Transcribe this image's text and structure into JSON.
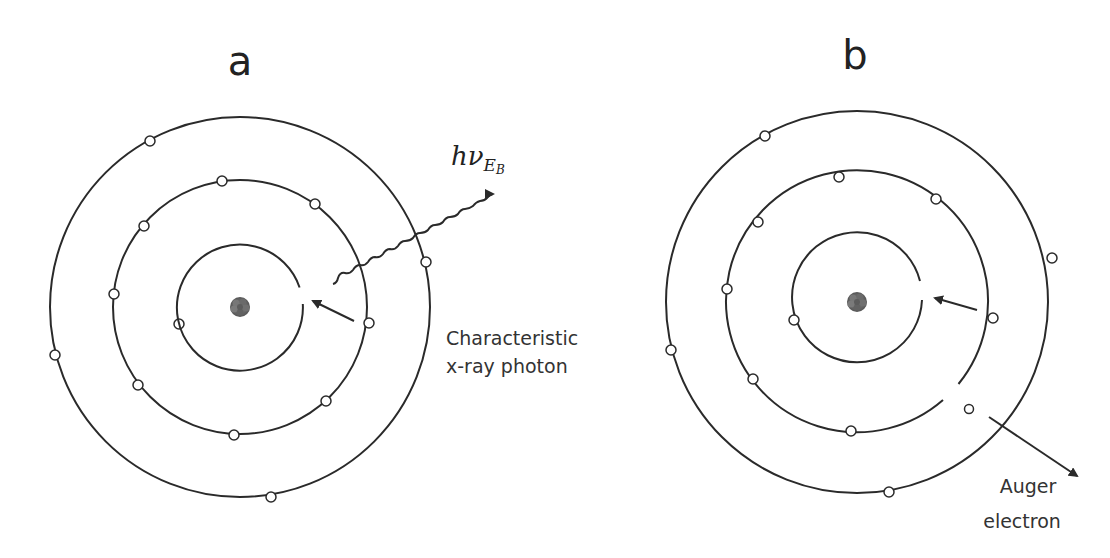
{
  "figure": {
    "panels": [
      {
        "id": "a",
        "label": "a",
        "center": [
          240,
          307
        ],
        "shell_radii": [
          63,
          127,
          190
        ],
        "vacancy": "inner shell (K) vacancy on right side",
        "electrons": {
          "inner": [
            [
              179,
              324
            ]
          ],
          "middle": [
            [
              222,
              181
            ],
            [
              315,
              204
            ],
            [
              144,
              226
            ],
            [
              114,
              294
            ],
            [
              369,
              323
            ],
            [
              138,
              385
            ],
            [
              326,
              401
            ],
            [
              234,
              435
            ]
          ],
          "outer": [
            [
              150,
              141
            ],
            [
              426,
              262
            ],
            [
              55,
              355
            ],
            [
              271,
              497
            ]
          ]
        },
        "emission": {
          "type": "photon",
          "symbol_main": "hν",
          "symbol_sub": "E",
          "symbol_subsub": "B",
          "caption_line1": "Characteristic",
          "caption_line2": "x-ray photon"
        }
      },
      {
        "id": "b",
        "label": "b",
        "center": [
          857,
          302
        ],
        "shell_radii": [
          65,
          131,
          191
        ],
        "vacancy": "inner shell (K) vacancy on right side; middle shell gap where electron ejected",
        "electrons": {
          "inner": [
            [
              794,
              320
            ]
          ],
          "middle": [
            [
              839,
              177
            ],
            [
              936,
              199
            ],
            [
              758,
              222
            ],
            [
              727,
              289
            ],
            [
              993,
              318
            ],
            [
              753,
              379
            ],
            [
              851,
              431
            ]
          ],
          "outer": [
            [
              765,
              136
            ],
            [
              1052,
              258
            ],
            [
              671,
              350
            ],
            [
              889,
              492
            ]
          ],
          "ejected": [
            [
              969,
              409
            ]
          ]
        },
        "emission": {
          "type": "auger",
          "caption_line1": "Auger",
          "caption_line2": "electron"
        }
      }
    ],
    "colors": {
      "line": "#2a2a2a",
      "nucleus": "#6e6e6e",
      "text": "#333333",
      "background": "#ffffff"
    }
  }
}
